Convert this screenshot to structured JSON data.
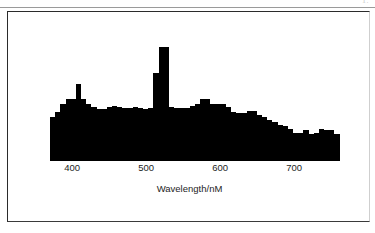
{
  "page": {
    "artifact_text": "1.",
    "background_color": "#ffffff",
    "frame_color": "#2b2b2b"
  },
  "chart_data": {
    "type": "bar",
    "title": "",
    "subtitle": "",
    "xlabel": "Wavelength/nM",
    "ylabel": "",
    "grid": false,
    "legend": false,
    "legend_position": "none",
    "bar_color": "#000000",
    "xlim": [
      370,
      762
    ],
    "ylim": [
      0,
      100
    ],
    "xticks": [
      400,
      500,
      600,
      700
    ],
    "xtick_labels": [
      "400",
      "500",
      "600",
      "700"
    ],
    "x": [
      373,
      380,
      387,
      394,
      401,
      408,
      415,
      422,
      429,
      436,
      443,
      450,
      457,
      464,
      471,
      478,
      485,
      492,
      499,
      506,
      513,
      520,
      527,
      534,
      541,
      548,
      555,
      562,
      569,
      576,
      583,
      590,
      597,
      604,
      611,
      618,
      625,
      632,
      639,
      646,
      653,
      660,
      667,
      674,
      681,
      688,
      695,
      702,
      709,
      716,
      723,
      730,
      737,
      744,
      751,
      758
    ],
    "values": [
      34,
      38,
      44,
      48,
      48,
      60,
      48,
      44,
      42,
      40,
      40,
      42,
      43,
      42,
      41,
      41,
      42,
      41,
      40,
      41,
      68,
      88,
      88,
      42,
      41,
      41,
      41,
      43,
      44,
      48,
      48,
      44,
      44,
      44,
      42,
      38,
      37,
      37,
      39,
      39,
      36,
      34,
      32,
      30,
      28,
      27,
      25,
      22,
      22,
      24,
      21,
      22,
      25,
      24,
      24,
      21
    ]
  },
  "axis": {
    "ticks": [
      {
        "label": "400",
        "value": 400
      },
      {
        "label": "500",
        "value": 500
      },
      {
        "label": "600",
        "value": 600
      },
      {
        "label": "700",
        "value": 700
      }
    ],
    "title": "Wavelength/nM"
  }
}
